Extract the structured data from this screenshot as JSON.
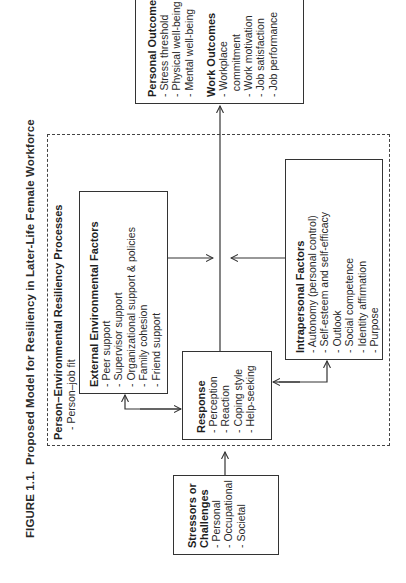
{
  "figure": {
    "label": "FIGURE 1.1.",
    "title": "Proposed Model for Resiliency in Later-Life Female Workforce"
  },
  "stressors": {
    "heading_line1": "Stressors or",
    "heading_line2": "Challenges",
    "items": [
      "Personal",
      "Occupational",
      "Societal"
    ]
  },
  "processes": {
    "heading": "Person–Environmental Resiliency Processes",
    "items": [
      "Person–job fit"
    ]
  },
  "external": {
    "heading": "External Environmental Factors",
    "items": [
      "Peer support",
      "Supervisor support",
      "Organizational support & policies",
      "Family cohesion",
      "Friend support"
    ]
  },
  "response": {
    "heading": "Response",
    "items": [
      "Perception",
      "Reaction",
      "Coping style",
      "Help-seeking"
    ]
  },
  "intrapersonal": {
    "heading": "Intrapersonal Factors",
    "items": [
      "Autonomy (personal control)",
      "Self-esteem and self-efficacy",
      "Outlook",
      "Social competence",
      "Identity affirmation",
      "Purpose"
    ]
  },
  "outcomes": {
    "personal_heading": "Personal Outcomes",
    "personal_items": [
      "Stress threshold",
      "Physical well-being",
      "Mental well-being"
    ],
    "work_heading": "Work Outcomes",
    "work_items": [
      "Workplace",
      "commitment",
      "Work motivation",
      "Job satisfaction",
      "Job performance"
    ]
  },
  "colors": {
    "line": "#333333",
    "text": "#1e1e1e",
    "background": "#ffffff"
  },
  "orientation": "rotated -90deg (page landscape)"
}
